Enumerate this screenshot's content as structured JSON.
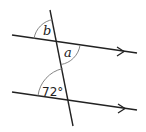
{
  "diagram": {
    "title": "",
    "labels": {
      "angle_b": "b",
      "angle_a": "a",
      "angle_given": "72°"
    },
    "colors": {
      "line": "#222222",
      "arc": "#777777",
      "background": "#ffffff"
    }
  }
}
